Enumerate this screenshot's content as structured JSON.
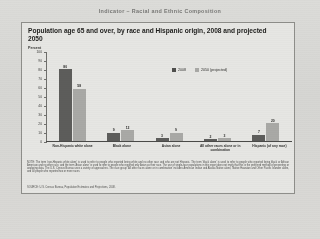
{
  "running_head": "Indicator  –  Racial and Ethnic Composition",
  "panel": {
    "title": "Population age 65 and over, by race and Hispanic origin, 2008 and projected 2050",
    "axis_label": "Percent",
    "notes": "NOTE: The term 'non-Hispanic white alone' is used to refer to people who reported being white and no other race and who are not Hispanic. The term 'black alone' is used to refer to people who reported being black or African American and no other race, and the term 'Asian alone' is used to refer to people who reported only Asian as their race. The use of single-race populations in this report does not imply that this is the preferred method of presenting or analyzing data. The U.S. Census Bureau uses a variety of approaches. The race group 'All other races alone or in combination' includes American Indian and Alaska Native alone, Native Hawaiian and Other Pacific Islander alone, and all people who reported two or more races.",
    "source": "SOURCE: U.S. Census Bureau, Population Estimates and Projections, 2008."
  },
  "chart_data": {
    "type": "bar",
    "title": "Population age 65 and over, by race and Hispanic origin, 2008 and projected 2050",
    "xlabel": "",
    "ylabel": "Percent",
    "ylim": [
      0,
      100
    ],
    "yticks": [
      0,
      10,
      20,
      30,
      40,
      50,
      60,
      70,
      80,
      90,
      100
    ],
    "grid": false,
    "legend_position": "top-right",
    "categories": [
      "Non-Hispanic white alone",
      "Black alone",
      "Asian alone",
      "All other races alone or in combination",
      "Hispanic (of any race)"
    ],
    "series": [
      {
        "name": "2008",
        "color": "#5d5d5b",
        "values": [
          80,
          9,
          3,
          2,
          7
        ]
      },
      {
        "name": "2050 (projected)",
        "color": "#a9a9a6",
        "values": [
          58,
          12,
          9,
          3,
          20
        ]
      }
    ]
  }
}
